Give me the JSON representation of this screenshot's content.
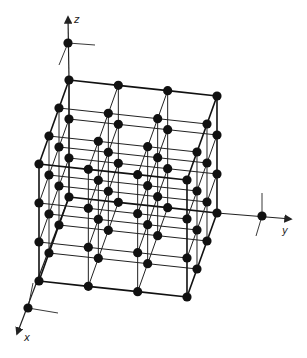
{
  "diagram": {
    "type": "3d-cubic-lattice",
    "lattice": {
      "nx": 4,
      "ny": 4,
      "nz": 4
    },
    "projection": {
      "origin_px": [
        69,
        197
      ],
      "x_step_px": [
        -10,
        28
      ],
      "y_step_px": [
        49.33,
        5.33
      ],
      "z_step_px": [
        0,
        -39
      ]
    },
    "colors": {
      "line": "#222222",
      "node": "#111111",
      "background": "#ffffff"
    },
    "node_radius": 4.6,
    "axes": [
      {
        "name": "x",
        "label": "x",
        "from": [
          69,
          197
        ],
        "point": [
          28,
          308
        ],
        "tip": [
          17,
          334
        ],
        "label_pos": [
          24,
          341
        ],
        "ticks": [
          [
            33,
            283
          ],
          [
            58,
            313
          ]
        ]
      },
      {
        "name": "y",
        "label": "y",
        "from": [
          217,
          213
        ],
        "point": [
          262,
          216
        ],
        "tip": [
          291,
          219
        ],
        "label_pos": [
          282,
          234
        ],
        "ticks": [
          [
            262,
            193
          ],
          [
            256,
            236
          ]
        ]
      },
      {
        "name": "z",
        "label": "z",
        "from": [
          69,
          80
        ],
        "point": [
          68,
          43
        ],
        "tip": [
          68,
          17
        ],
        "label_pos": [
          74,
          23
        ],
        "ticks": [
          [
            95,
            45
          ],
          [
            59,
            65
          ]
        ]
      }
    ]
  }
}
